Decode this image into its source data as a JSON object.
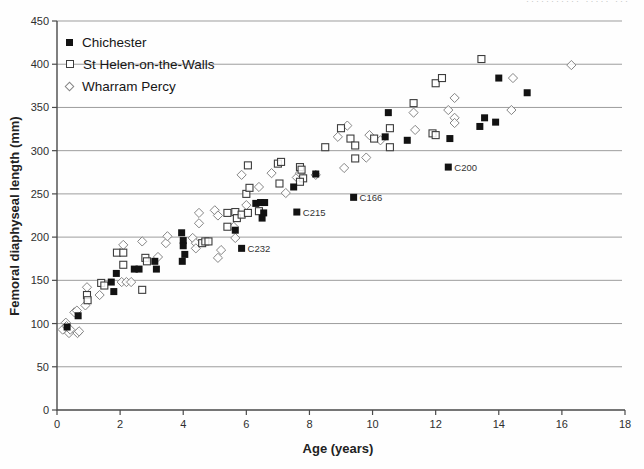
{
  "page_fragment": "··········· ····· ···",
  "chart_data": {
    "type": "scatter",
    "title": "",
    "xlabel": "Age (years)",
    "ylabel": "Femoral diaphyseal length (mm)",
    "xlim": [
      0,
      18
    ],
    "ylim": [
      0,
      450
    ],
    "x_ticks": [
      0,
      2,
      4,
      6,
      8,
      10,
      12,
      14,
      16,
      18
    ],
    "y_ticks": [
      0,
      50,
      100,
      150,
      200,
      250,
      300,
      350,
      400,
      450
    ],
    "grid": "horizontal",
    "legend_position": "top-left-inside",
    "series": [
      {
        "name": "Chichester",
        "marker": "filled-square",
        "color": "#121212",
        "points": [
          [
            0.32,
            96
          ],
          [
            0.67,
            109
          ],
          [
            1.72,
            148
          ],
          [
            1.8,
            137
          ],
          [
            1.88,
            158
          ],
          [
            2.45,
            163
          ],
          [
            2.6,
            163
          ],
          [
            3.1,
            172
          ],
          [
            3.15,
            163
          ],
          [
            3.95,
            205
          ],
          [
            4.0,
            196
          ],
          [
            4.0,
            190
          ],
          [
            4.05,
            180
          ],
          [
            3.97,
            172
          ],
          [
            5.65,
            208
          ],
          [
            5.85,
            187
          ],
          [
            6.3,
            239
          ],
          [
            6.45,
            240
          ],
          [
            6.58,
            240
          ],
          [
            6.55,
            228
          ],
          [
            6.5,
            222
          ],
          [
            7.5,
            258
          ],
          [
            7.6,
            229
          ],
          [
            8.2,
            273
          ],
          [
            9.4,
            246
          ],
          [
            10.4,
            316
          ],
          [
            10.5,
            344
          ],
          [
            11.1,
            312
          ],
          [
            12.4,
            281
          ],
          [
            12.45,
            314
          ],
          [
            13.4,
            328
          ],
          [
            13.55,
            338
          ],
          [
            13.9,
            333
          ],
          [
            14.0,
            384
          ],
          [
            14.9,
            367
          ]
        ]
      },
      {
        "name": "St Helen-on-the-Walls",
        "marker": "open-square",
        "color": "#3d3d3d",
        "points": [
          [
            0.95,
            133
          ],
          [
            0.97,
            127
          ],
          [
            1.4,
            147
          ],
          [
            1.5,
            144
          ],
          [
            1.9,
            182
          ],
          [
            2.1,
            182
          ],
          [
            2.1,
            168
          ],
          [
            2.7,
            139
          ],
          [
            2.8,
            176
          ],
          [
            2.85,
            172
          ],
          [
            4.6,
            193
          ],
          [
            4.7,
            195
          ],
          [
            4.8,
            195
          ],
          [
            5.4,
            212
          ],
          [
            5.4,
            228
          ],
          [
            5.65,
            229
          ],
          [
            5.7,
            222
          ],
          [
            5.85,
            226
          ],
          [
            6.05,
            228
          ],
          [
            6.4,
            230
          ],
          [
            6.0,
            250
          ],
          [
            6.1,
            257
          ],
          [
            6.05,
            283
          ],
          [
            7.0,
            285
          ],
          [
            7.1,
            287
          ],
          [
            7.05,
            262
          ],
          [
            7.7,
            281
          ],
          [
            7.75,
            278
          ],
          [
            7.8,
            268
          ],
          [
            7.7,
            264
          ],
          [
            8.5,
            304
          ],
          [
            9.0,
            326
          ],
          [
            9.3,
            314
          ],
          [
            9.45,
            306
          ],
          [
            9.45,
            291
          ],
          [
            10.05,
            314
          ],
          [
            10.55,
            326
          ],
          [
            10.55,
            304
          ],
          [
            11.3,
            355
          ],
          [
            11.9,
            320
          ],
          [
            12.0,
            318
          ],
          [
            12.0,
            378
          ],
          [
            12.2,
            384
          ],
          [
            13.45,
            406
          ]
        ]
      },
      {
        "name": "Wharram Percy",
        "marker": "open-diamond",
        "color": "#858585",
        "points": [
          [
            0.18,
            93
          ],
          [
            0.28,
            101
          ],
          [
            0.3,
            97
          ],
          [
            0.38,
            89
          ],
          [
            0.42,
            93
          ],
          [
            0.55,
            113
          ],
          [
            0.63,
            115
          ],
          [
            0.65,
            89
          ],
          [
            0.7,
            91
          ],
          [
            0.9,
            121
          ],
          [
            0.95,
            142
          ],
          [
            1.35,
            133
          ],
          [
            2.05,
            148
          ],
          [
            2.2,
            148
          ],
          [
            2.35,
            148
          ],
          [
            2.1,
            191
          ],
          [
            2.7,
            195
          ],
          [
            3.2,
            177
          ],
          [
            3.45,
            193
          ],
          [
            3.5,
            201
          ],
          [
            4.3,
            199
          ],
          [
            4.4,
            193
          ],
          [
            4.4,
            187
          ],
          [
            4.5,
            216
          ],
          [
            4.5,
            228
          ],
          [
            5.0,
            231
          ],
          [
            5.1,
            225
          ],
          [
            5.1,
            176
          ],
          [
            5.2,
            185
          ],
          [
            5.6,
            212
          ],
          [
            5.65,
            199
          ],
          [
            6.0,
            237
          ],
          [
            6.4,
            258
          ],
          [
            5.85,
            272
          ],
          [
            6.8,
            274
          ],
          [
            7.25,
            251
          ],
          [
            7.6,
            269
          ],
          [
            7.7,
            274
          ],
          [
            8.2,
            272
          ],
          [
            8.9,
            316
          ],
          [
            9.1,
            280
          ],
          [
            9.2,
            329
          ],
          [
            9.8,
            292
          ],
          [
            9.9,
            318
          ],
          [
            10.25,
            312
          ],
          [
            11.3,
            344
          ],
          [
            11.35,
            324
          ],
          [
            12.4,
            347
          ],
          [
            12.6,
            361
          ],
          [
            12.6,
            338
          ],
          [
            12.6,
            332
          ],
          [
            14.4,
            347
          ],
          [
            14.45,
            384
          ],
          [
            16.3,
            399
          ]
        ]
      }
    ],
    "annotations": [
      {
        "text": "C232",
        "age": 5.85,
        "length": 187
      },
      {
        "text": "C215",
        "age": 7.6,
        "length": 229
      },
      {
        "text": "C166",
        "age": 9.4,
        "length": 246
      },
      {
        "text": "C200",
        "age": 12.4,
        "length": 281
      }
    ]
  }
}
